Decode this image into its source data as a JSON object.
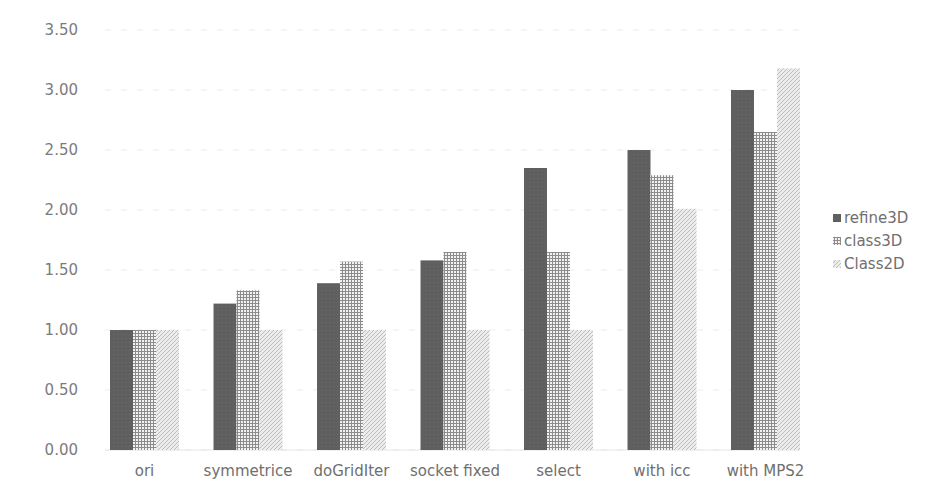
{
  "chart_data": {
    "type": "bar",
    "title": "",
    "xlabel": "",
    "ylabel": "",
    "ylim": [
      0,
      3.5
    ],
    "yticks": [
      "0.00",
      "0.50",
      "1.00",
      "1.50",
      "2.00",
      "2.50",
      "3.00",
      "3.50"
    ],
    "grid": true,
    "legend_position": "right",
    "categories": [
      "ori",
      "symmetrice",
      "doGridIter",
      "socket fixed",
      "select",
      "with icc",
      "with MPS2"
    ],
    "series": [
      {
        "name": "refine3D",
        "pattern": "solid-dark",
        "color": "#5f5f5f",
        "values": [
          1.0,
          1.22,
          1.39,
          1.58,
          2.35,
          2.5,
          3.0
        ]
      },
      {
        "name": "class3D",
        "pattern": "grid",
        "color": "#8a8a8a",
        "values": [
          1.0,
          1.33,
          1.57,
          1.65,
          1.65,
          2.29,
          2.65
        ]
      },
      {
        "name": "Class2D",
        "pattern": "diagonal-light",
        "color": "#c8c8c8",
        "values": [
          1.0,
          1.0,
          1.0,
          1.0,
          1.0,
          2.01,
          3.18
        ]
      }
    ]
  },
  "legend": {
    "items": [
      {
        "label": "refine3D",
        "icon": "solid-square-icon"
      },
      {
        "label": "class3D",
        "icon": "hash-grid-icon"
      },
      {
        "label": "Class2D",
        "icon": "diagonal-hatch-icon"
      }
    ]
  }
}
